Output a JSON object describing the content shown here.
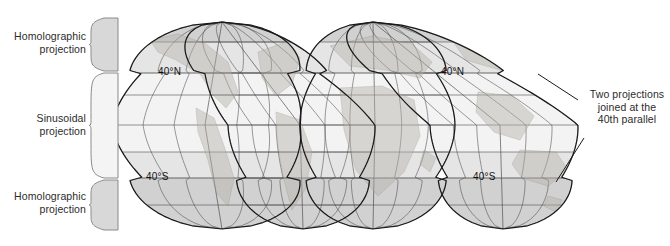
{
  "figure": {
    "background": "#ffffff"
  },
  "labels": {
    "homolographic_top": "Homolographic\nprojection",
    "sinusoidal": "Sinusoidal\nprojection",
    "homolographic_bottom": "Homolographic\nprojection",
    "annotation_right": "Two projections\njoined at the\n40th parallel"
  },
  "graticule_labels": {
    "north_left": "40°N",
    "south_left": "40°S",
    "north_right": "40°N",
    "south_right": "40°S"
  },
  "colors": {
    "outline": "#1a1a1a",
    "graticule": "#4a4a4a",
    "band_light": "#f2f2f2",
    "band_mid": "#e4e4e4",
    "band_dark": "#cfcfcf",
    "land": "#b7b2a8",
    "brace": "#8a8a8a",
    "brace_fill_gray": "#d8d8d8",
    "brace_fill_light": "#f4f4f4",
    "leader": "#1a1a1a",
    "text": "#2b2b2b"
  },
  "geometry": {
    "parallels_y": [
      42,
      73,
      95,
      125,
      152,
      178,
      205
    ],
    "lobe_top_y": 22,
    "lobe_bottom_y": 229,
    "equator_y": 125,
    "parallel_40n_y": 73,
    "parallel_40s_y": 178,
    "lobes": [
      {
        "name": "lobe-americas-west",
        "center_x": 205,
        "top_x": 222,
        "bottom_x": 222,
        "left_x": 112,
        "right_x": 300
      },
      {
        "name": "lobe-americas-east",
        "center_x": 300,
        "top_x": 222,
        "bottom_x": 303,
        "left_x": 228,
        "right_x": 375
      },
      {
        "name": "lobe-africa-europe",
        "center_x": 375,
        "top_x": 373,
        "bottom_x": 373,
        "left_x": 300,
        "right_x": 455
      },
      {
        "name": "lobe-asia-australia",
        "center_x": 500,
        "top_x": 373,
        "bottom_x": 503,
        "left_x": 430,
        "right_x": 578
      }
    ]
  },
  "braces": [
    {
      "name": "brace-homolographic-top",
      "y_top": 18,
      "y_bottom": 71,
      "fill": "gray"
    },
    {
      "name": "brace-sinusoidal",
      "y_top": 73,
      "y_bottom": 178,
      "fill": "light"
    },
    {
      "name": "brace-homolographic-bottom",
      "y_top": 180,
      "y_bottom": 230,
      "fill": "gray"
    }
  ],
  "leader_lines": [
    {
      "name": "leader-upper",
      "from": [
        578,
        100
      ],
      "to": [
        538,
        74
      ]
    },
    {
      "name": "leader-lower",
      "from": [
        584,
        138
      ],
      "to": [
        556,
        182
      ]
    }
  ]
}
